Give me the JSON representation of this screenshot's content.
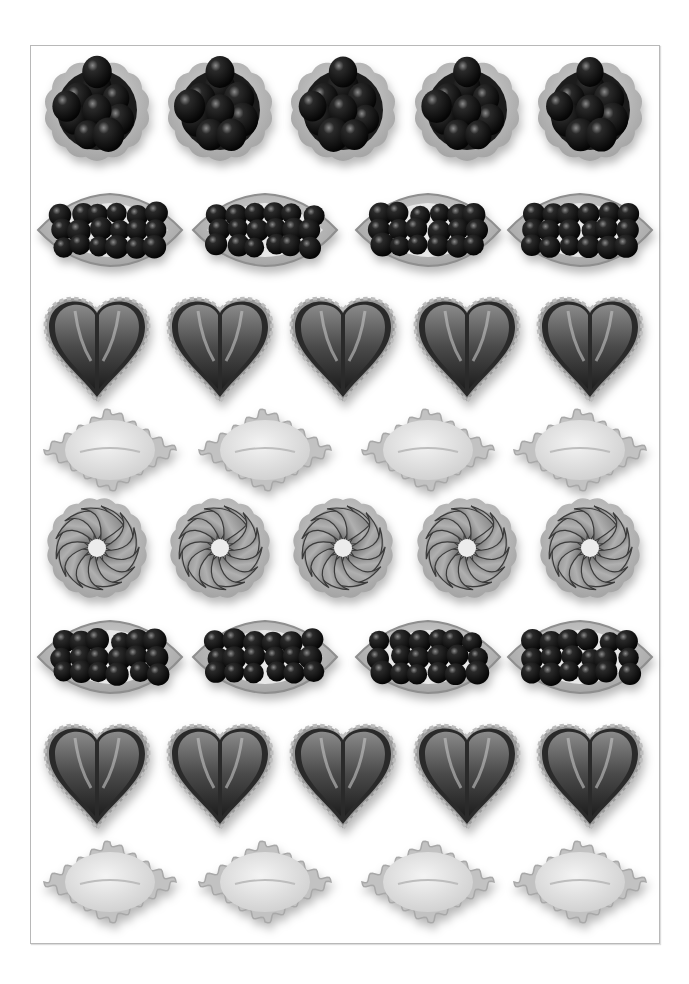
{
  "image": {
    "description": "Grayscale overhead photograph of assorted fruit tarts arranged in 8 rows inside a thin rectangular frame",
    "palette": {
      "background": "#ffffff",
      "frame": "#b8b8b8",
      "dark_fruit": "#1a1a1a",
      "crust": "#9a9a9a",
      "cream": "#dcdcdc",
      "strawberry": "#5a5a5a"
    }
  },
  "rows": [
    {
      "type": "berry-round",
      "count": 5,
      "y": 110
    },
    {
      "type": "berry-boat",
      "count": 4,
      "y": 230
    },
    {
      "type": "strawberry-heart",
      "count": 5,
      "y": 345
    },
    {
      "type": "cream-diamond",
      "count": 4,
      "y": 450
    },
    {
      "type": "apple-spiral",
      "count": 5,
      "y": 548
    },
    {
      "type": "berry-boat",
      "count": 4,
      "y": 657
    },
    {
      "type": "strawberry-heart",
      "count": 5,
      "y": 772
    },
    {
      "type": "cream-diamond",
      "count": 4,
      "y": 882
    }
  ],
  "columns": {
    "five": [
      97,
      220,
      343,
      467,
      590
    ],
    "four": [
      110,
      265,
      428,
      580
    ]
  }
}
